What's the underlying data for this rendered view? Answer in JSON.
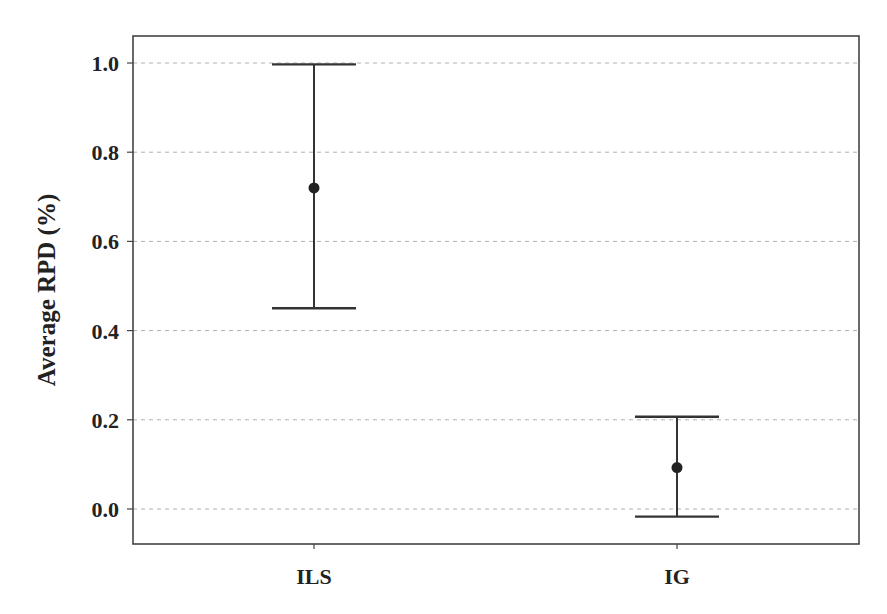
{
  "chart_data": {
    "type": "errorbar",
    "title": "",
    "xlabel": "",
    "ylabel": "Average RPD (%)",
    "categories": [
      "ILS",
      "IG"
    ],
    "series": [
      {
        "name": "Average RPD",
        "values": [
          0.72,
          0.093
        ],
        "error_low": [
          0.45,
          -0.017
        ],
        "error_high": [
          0.997,
          0.207
        ]
      }
    ],
    "yticks": [
      "0.0",
      "0.2",
      "0.4",
      "0.6",
      "0.8",
      "1.0"
    ],
    "ylim": [
      -0.08,
      1.06
    ],
    "grid": {
      "y": true,
      "x": false,
      "style": "dashed"
    },
    "legend": null
  },
  "colors": {
    "line": "#333333",
    "marker": "#222222",
    "grid": "#b0b0b0",
    "frame": "#444444"
  }
}
